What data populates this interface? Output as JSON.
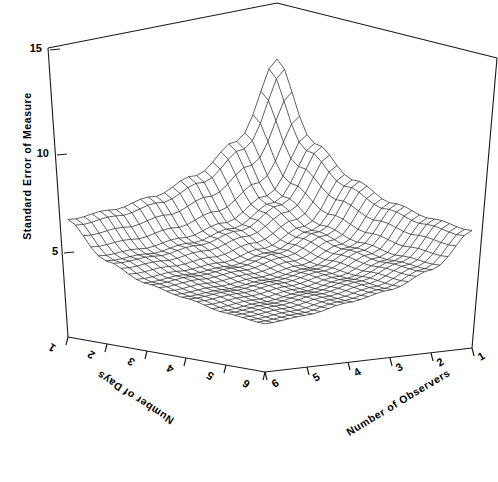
{
  "figure": {
    "kind": "3d-wireframe-surface-plot",
    "background": "#ffffff",
    "line_color": "#1a1a1a",
    "mesh_color": "#2b2b2b"
  },
  "axes": {
    "z": {
      "title": "Standard Error of Measure",
      "ticks": [
        "5",
        "10",
        "15"
      ],
      "tick_values": [
        5,
        10,
        15
      ],
      "range": [
        0,
        15
      ]
    },
    "x_left": {
      "title": "Number of Days",
      "ticks": [
        "1",
        "2",
        "3",
        "4",
        "5",
        "6"
      ],
      "tick_values": [
        1,
        2,
        3,
        4,
        5,
        6
      ],
      "range": [
        1,
        6
      ]
    },
    "x_right": {
      "title": "Number of Observers",
      "ticks": [
        "1",
        "2",
        "3",
        "4",
        "5",
        "6"
      ],
      "tick_values": [
        1,
        2,
        3,
        4,
        5,
        6
      ],
      "range": [
        1,
        6
      ]
    }
  },
  "chart_data": {
    "type": "surface",
    "title": "",
    "xlabel": "Number of Observers",
    "ylabel": "Number of Days",
    "zlabel": "Standard Error of Measure",
    "xlim": [
      1,
      6
    ],
    "ylim": [
      1,
      6
    ],
    "zlim": [
      0,
      15
    ],
    "grid": false,
    "legend": "none",
    "x": [
      1,
      2,
      3,
      4,
      5,
      6
    ],
    "y": [
      1,
      2,
      3,
      4,
      5,
      6
    ],
    "z_note": "Standard Error of Measure decreases as both observers and days increase; peak at (1 observer, 1 day), minimum at (6 observers, 6 days).",
    "z": [
      [
        15.0,
        10.6,
        8.7,
        7.5,
        6.7,
        6.1
      ],
      [
        10.6,
        7.5,
        6.1,
        5.3,
        4.7,
        4.3
      ],
      [
        8.7,
        6.1,
        5.0,
        4.3,
        3.9,
        3.5
      ],
      [
        7.5,
        5.3,
        4.3,
        3.8,
        3.4,
        3.1
      ],
      [
        6.7,
        4.7,
        3.9,
        3.4,
        3.0,
        2.7
      ],
      [
        6.1,
        4.3,
        3.5,
        3.1,
        2.7,
        2.5
      ]
    ],
    "mesh_divisions": 26
  }
}
